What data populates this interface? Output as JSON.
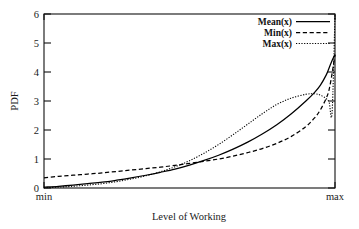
{
  "chart_data": {
    "type": "line",
    "title": "",
    "xlabel": "Level of Working",
    "ylabel": "PDF",
    "xlim": [
      0,
      1
    ],
    "ylim": [
      0,
      6
    ],
    "grid": false,
    "legend_position": "top-right",
    "x_tick_labels": [
      "min",
      "max"
    ],
    "y_tick_labels": [
      "0",
      "1",
      "2",
      "3",
      "4",
      "5",
      "6"
    ],
    "y_ticks": [
      0,
      1,
      2,
      3,
      4,
      5,
      6
    ],
    "x": [
      0,
      0.05,
      0.1,
      0.15,
      0.2,
      0.25,
      0.3,
      0.35,
      0.4,
      0.45,
      0.5,
      0.55,
      0.6,
      0.65,
      0.7,
      0.75,
      0.8,
      0.85,
      0.9,
      0.93,
      0.95,
      0.97,
      0.98,
      0.99,
      1.0
    ],
    "series": [
      {
        "name": "Mean(x)",
        "style": "solid",
        "values": [
          0.03,
          0.06,
          0.1,
          0.15,
          0.2,
          0.27,
          0.35,
          0.44,
          0.54,
          0.65,
          0.79,
          0.95,
          1.13,
          1.34,
          1.58,
          1.86,
          2.18,
          2.56,
          3.0,
          3.3,
          3.55,
          3.9,
          4.15,
          4.4,
          4.6
        ]
      },
      {
        "name": "Min(x)",
        "style": "dashed",
        "values": [
          0.35,
          0.4,
          0.44,
          0.48,
          0.52,
          0.57,
          0.62,
          0.67,
          0.72,
          0.78,
          0.85,
          0.92,
          1.0,
          1.1,
          1.22,
          1.36,
          1.54,
          1.78,
          2.12,
          2.42,
          2.7,
          3.1,
          3.4,
          3.95,
          4.6
        ]
      },
      {
        "name": "Max(x)",
        "style": "dotted",
        "values": [
          0.01,
          0.03,
          0.06,
          0.1,
          0.15,
          0.22,
          0.31,
          0.42,
          0.56,
          0.73,
          0.94,
          1.2,
          1.5,
          1.84,
          2.2,
          2.56,
          2.88,
          3.1,
          3.23,
          3.25,
          3.2,
          3.08,
          2.95,
          2.6,
          6.0
        ]
      }
    ],
    "annotations": [
      "Max(x) curve peaks near 3.25 just before max then collapses with a near-vertical spike at the right boundary",
      "All three curves converge around PDF 1 near the mid-right of the axis"
    ]
  },
  "axis": {
    "x_min_label": "min",
    "x_max_label": "max",
    "x_title": "Level of Working",
    "y_title": "PDF"
  },
  "legend": {
    "entries": [
      {
        "label": "Mean(x)"
      },
      {
        "label": "Min(x)"
      },
      {
        "label": "Max(x)"
      }
    ]
  },
  "colors": {
    "ink": "#111111",
    "background": "#ffffff",
    "curve": "#000000"
  }
}
